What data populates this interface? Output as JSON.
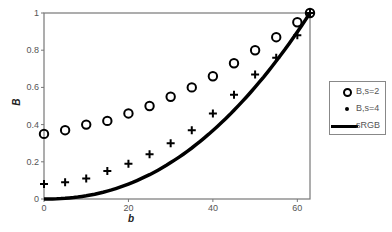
{
  "chart_data": {
    "type": "scatter",
    "title": "",
    "xlabel": "b",
    "ylabel": "B",
    "xlim": [
      0,
      63
    ],
    "ylim": [
      0,
      1
    ],
    "x_ticks": [
      "0",
      "20",
      "40",
      "60"
    ],
    "y_ticks": [
      "0",
      "0.2",
      "0.4",
      "0.6",
      "0.8",
      "1"
    ],
    "grid": false,
    "legend_position": "right",
    "x": [
      0,
      5,
      10,
      15,
      20,
      25,
      30,
      35,
      40,
      45,
      50,
      55,
      60,
      63
    ],
    "series": [
      {
        "name": "B,s=2",
        "marker": "circle",
        "values": [
          0.35,
          0.37,
          0.4,
          0.42,
          0.46,
          0.5,
          0.55,
          0.6,
          0.66,
          0.73,
          0.8,
          0.87,
          0.95,
          1.0
        ]
      },
      {
        "name": "B,s=4",
        "marker": "plus",
        "values": [
          0.08,
          0.09,
          0.11,
          0.15,
          0.19,
          0.24,
          0.3,
          0.37,
          0.46,
          0.56,
          0.67,
          0.76,
          0.88,
          1.0
        ]
      },
      {
        "name": "sRGB",
        "marker": "line",
        "values": [
          0.0,
          0.005,
          0.02,
          0.05,
          0.09,
          0.14,
          0.2,
          0.28,
          0.37,
          0.48,
          0.6,
          0.74,
          0.9,
          1.0
        ]
      }
    ]
  },
  "legend": {
    "items": [
      "B,s=2",
      "B,s=4",
      "sRGB"
    ]
  },
  "axes": {
    "xlabel": "b",
    "ylabel": "B"
  }
}
